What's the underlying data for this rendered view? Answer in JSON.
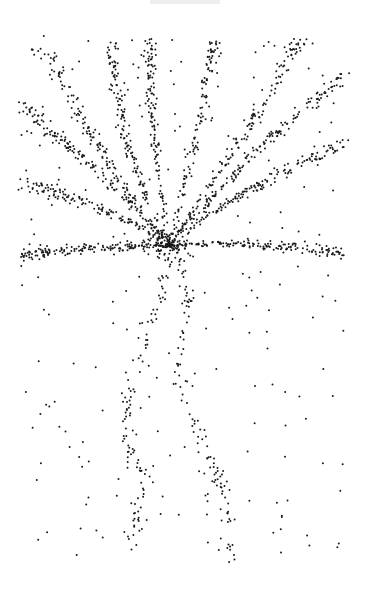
{
  "image": {
    "subject": "stippled palm tree",
    "background": "#ffffff",
    "dot_color": "#1a1a1a",
    "dot_radius": 1.0,
    "canvas": {
      "width": 365,
      "height": 593
    }
  },
  "art": {
    "center": [
      170,
      245
    ],
    "fronds": [
      {
        "from": [
          170,
          245
        ],
        "ctrl": [
          110,
          180
        ],
        "to": [
          40,
          40
        ],
        "n": 150,
        "spread": 9
      },
      {
        "from": [
          170,
          245
        ],
        "ctrl": [
          120,
          160
        ],
        "to": [
          110,
          40
        ],
        "n": 130,
        "spread": 8
      },
      {
        "from": [
          170,
          245
        ],
        "ctrl": [
          150,
          140
        ],
        "to": [
          150,
          40
        ],
        "n": 120,
        "spread": 7
      },
      {
        "from": [
          170,
          245
        ],
        "ctrl": [
          195,
          150
        ],
        "to": [
          215,
          40
        ],
        "n": 120,
        "spread": 8
      },
      {
        "from": [
          170,
          245
        ],
        "ctrl": [
          230,
          160
        ],
        "to": [
          300,
          40
        ],
        "n": 150,
        "spread": 9
      },
      {
        "from": [
          170,
          245
        ],
        "ctrl": [
          250,
          150
        ],
        "to": [
          345,
          75
        ],
        "n": 150,
        "spread": 9
      },
      {
        "from": [
          170,
          245
        ],
        "ctrl": [
          250,
          180
        ],
        "to": [
          345,
          145
        ],
        "n": 140,
        "spread": 9
      },
      {
        "from": [
          170,
          245
        ],
        "ctrl": [
          90,
          160
        ],
        "to": [
          20,
          105
        ],
        "n": 140,
        "spread": 9
      },
      {
        "from": [
          170,
          245
        ],
        "ctrl": [
          90,
          195
        ],
        "to": [
          20,
          185
        ],
        "n": 130,
        "spread": 9
      },
      {
        "from": [
          170,
          245
        ],
        "ctrl": [
          100,
          245
        ],
        "to": [
          25,
          255
        ],
        "n": 150,
        "spread": 8
      },
      {
        "from": [
          170,
          245
        ],
        "ctrl": [
          260,
          240
        ],
        "to": [
          345,
          255
        ],
        "n": 150,
        "spread": 8
      }
    ],
    "trunks": [
      {
        "points": [
          [
            170,
            248
          ],
          [
            160,
            300
          ],
          [
            130,
            380
          ],
          [
            125,
            440
          ],
          [
            145,
            480
          ],
          [
            130,
            555
          ]
        ],
        "n": 110,
        "spread": 10
      },
      {
        "points": [
          [
            178,
            248
          ],
          [
            190,
            300
          ],
          [
            178,
            370
          ],
          [
            200,
            440
          ],
          [
            225,
            490
          ],
          [
            232,
            565
          ]
        ],
        "n": 110,
        "spread": 10
      }
    ],
    "scatter_count": 260
  }
}
